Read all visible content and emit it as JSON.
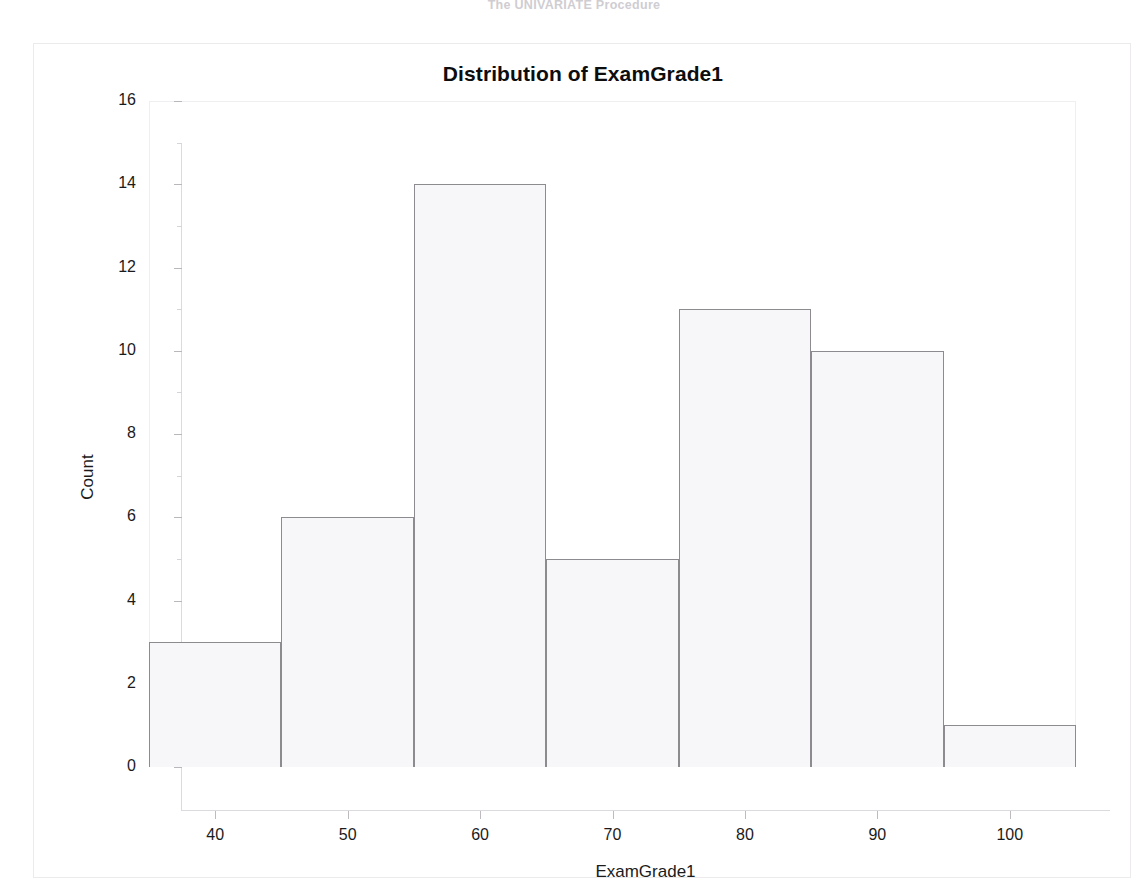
{
  "page": {
    "proc_header": "The UNIVARIATE Procedure",
    "bottom_caption": ""
  },
  "chart_data": {
    "type": "bar",
    "subtype": "histogram",
    "title": "Distribution of ExamGrade1",
    "xlabel": "ExamGrade1",
    "ylabel": "Count",
    "xlim": [
      35,
      105
    ],
    "ylim": [
      0,
      16
    ],
    "grid": false,
    "legend": null,
    "bin_width": 10,
    "bin_edges": [
      35,
      45,
      55,
      65,
      75,
      85,
      95,
      105
    ],
    "bin_centers": [
      40,
      50,
      60,
      70,
      80,
      90,
      100
    ],
    "categories": [
      "35-45",
      "45-55",
      "55-65",
      "65-75",
      "75-85",
      "85-95",
      "95-105"
    ],
    "values": [
      3,
      6,
      14,
      5,
      11,
      10,
      1
    ],
    "xticks": [
      40,
      50,
      60,
      70,
      80,
      90,
      100
    ],
    "xtick_labels": [
      "40",
      "50",
      "60",
      "70",
      "80",
      "90",
      "100"
    ],
    "yticks": [
      0,
      2,
      4,
      6,
      8,
      10,
      12,
      14,
      16
    ],
    "ytick_labels": [
      "0",
      "2",
      "4",
      "6",
      "8",
      "10",
      "12",
      "14",
      "16"
    ],
    "colors": {
      "bar_fill": "#f7f6f8",
      "bar_edge": "#8d8b90",
      "axis": "#dcdade",
      "text": "#1b1b1b",
      "background": "#ffffff"
    }
  }
}
